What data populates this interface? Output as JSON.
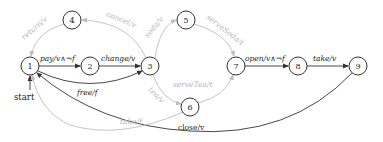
{
  "diagram": {
    "type": "state-machine",
    "start_label": "start",
    "nodes": [
      {
        "id": "1",
        "label": "1",
        "x": 30,
        "y": 66
      },
      {
        "id": "2",
        "label": "2",
        "x": 90,
        "y": 66
      },
      {
        "id": "3",
        "label": "3",
        "x": 150,
        "y": 66
      },
      {
        "id": "4",
        "label": "4",
        "x": 72,
        "y": 20
      },
      {
        "id": "5",
        "label": "5",
        "x": 186,
        "y": 20
      },
      {
        "id": "6",
        "label": "6",
        "x": 190,
        "y": 107
      },
      {
        "id": "7",
        "label": "7",
        "x": 236,
        "y": 66
      },
      {
        "id": "8",
        "label": "8",
        "x": 298,
        "y": 66
      },
      {
        "id": "9",
        "label": "9",
        "x": 358,
        "y": 66
      }
    ],
    "edges": [
      {
        "from": "1",
        "to": "2",
        "label": "pay/v∧¬f",
        "style": "dark"
      },
      {
        "from": "2",
        "to": "3",
        "label": "change/v",
        "style": "dark"
      },
      {
        "from": "3",
        "to": "4",
        "label": "cancel/v",
        "style": "light"
      },
      {
        "from": "4",
        "to": "1",
        "label": "return/v",
        "style": "light"
      },
      {
        "from": "3",
        "to": "5",
        "label": "soda/v",
        "style": "light"
      },
      {
        "from": "5",
        "to": "7",
        "label": "serveSoda/t",
        "style": "light"
      },
      {
        "from": "3",
        "to": "6",
        "label": "tea/v",
        "style": "light"
      },
      {
        "from": "6",
        "to": "7",
        "label": "serveTea/t",
        "style": "light"
      },
      {
        "from": "1",
        "to": "3",
        "label": "free/f",
        "style": "dark"
      },
      {
        "from": "7",
        "to": "8",
        "label": "open/v∧¬f",
        "style": "dark"
      },
      {
        "from": "8",
        "to": "9",
        "label": "take/v",
        "style": "dark"
      },
      {
        "from": "9",
        "to": "1",
        "label": "close/v",
        "style": "dark"
      },
      {
        "from": "6",
        "to": "1",
        "label": "take/f",
        "style": "light"
      }
    ]
  }
}
